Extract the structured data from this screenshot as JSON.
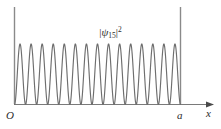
{
  "figure": {
    "kind": "physics-textbook-figure",
    "background_color": "#ffffff",
    "line_color": "#6e6e6e",
    "axis_color": "#7a7a7a",
    "text_color": "#2b2b2b",
    "width": 221,
    "height": 129
  },
  "labels": {
    "origin": "O",
    "well_width": "a",
    "x_axis": "x",
    "wave_bar_left": "|",
    "wave_symbol": "ψ",
    "wave_subscript": "15",
    "wave_bar_right": "|",
    "wave_exponent": "2"
  },
  "chart_data": {
    "type": "line",
    "xlabel": "x",
    "ylabel": "",
    "xlim": [
      0,
      1
    ],
    "ylim": [
      0,
      1
    ],
    "grid": false,
    "legend": null,
    "annotations": [
      {
        "text": "O",
        "x": 0,
        "y": 0,
        "role": "origin-tick"
      },
      {
        "text": "a",
        "x": 1,
        "y": 0,
        "role": "well-width-tick"
      },
      {
        "text": "x",
        "x": 1.12,
        "y": 0,
        "role": "axis-arrow-label"
      },
      {
        "text": "|ψ₁₅|²",
        "x": 0.5,
        "y": 1.18,
        "role": "curve-label"
      }
    ],
    "walls": [
      {
        "name": "left-wall",
        "x": 0
      },
      {
        "name": "right-wall",
        "x": 1
      }
    ],
    "quantum_number": 15,
    "function": "sin^2(n*pi*x/a)",
    "lobe_count": 15,
    "node_count": 16,
    "series": [
      {
        "name": "|psi_15|^2",
        "x": [
          0,
          0.0167,
          0.0333,
          0.05,
          0.0667,
          0.0833,
          0.1,
          0.1167,
          0.1333,
          0.15,
          0.1667,
          0.1833,
          0.2,
          0.2167,
          0.2333,
          0.25,
          0.2667,
          0.2833,
          0.3,
          0.3167,
          0.3333,
          0.35,
          0.3667,
          0.3833,
          0.4,
          0.4167,
          0.4333,
          0.45,
          0.4667,
          0.4833,
          0.5,
          0.5167,
          0.5333,
          0.55,
          0.5667,
          0.5833,
          0.6,
          0.6167,
          0.6333,
          0.65,
          0.6667,
          0.6833,
          0.7,
          0.7167,
          0.7333,
          0.75,
          0.7667,
          0.7833,
          0.8,
          0.8167,
          0.8333,
          0.85,
          0.8667,
          0.8833,
          0.9,
          0.9167,
          0.9333,
          0.95,
          0.9667,
          0.9833,
          1
        ],
        "y": [
          0,
          0.06,
          0.223,
          0.444,
          0.667,
          0.854,
          0.972,
          1.0,
          0.94,
          0.793,
          0.587,
          0.357,
          0.155,
          0.025,
          0.008,
          0.104,
          0.292,
          0.525,
          0.75,
          0.913,
          0.994,
          0.983,
          0.882,
          0.709,
          0.492,
          0.271,
          0.091,
          0.001,
          0.02,
          0.15,
          0.362,
          0.601,
          0.816,
          0.952,
          0.999,
          0.949,
          0.812,
          0.614,
          0.39,
          0.183,
          0.036,
          0.0,
          0.074,
          0.246,
          0.473,
          0.695,
          0.873,
          0.979,
          0.995,
          0.921,
          0.764,
          0.554,
          0.325,
          0.13,
          0.014,
          0.014,
          0.123,
          0.32,
          0.558,
          0.779,
          0.926
        ]
      }
    ]
  }
}
